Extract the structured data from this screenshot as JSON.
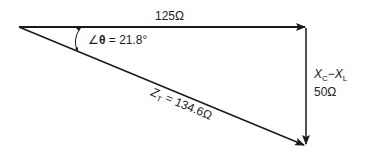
{
  "diagram": {
    "type": "impedance-triangle",
    "colors": {
      "line": "#1a1a1a",
      "text": "#222222",
      "background": "#ffffff"
    },
    "resistance": {
      "label": "125Ω"
    },
    "reactance": {
      "name_main": "X",
      "sub1": "C",
      "minus": "−",
      "name2": "X",
      "sub2": "L",
      "value": "50Ω"
    },
    "impedance": {
      "name": "Z",
      "sub": "T",
      "value": " = 134.6Ω"
    },
    "angle": {
      "symbol": "∠",
      "theta": "θ",
      "value": " = 21.8°"
    }
  }
}
